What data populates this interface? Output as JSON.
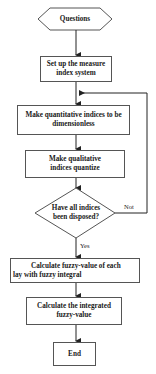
{
  "flowchart": {
    "start": {
      "label": "Questions",
      "shape": "hexagon"
    },
    "steps": [
      {
        "id": "setup",
        "label": "Set up the measure index system"
      },
      {
        "id": "quantitative",
        "label": "Make quantitative indices to be dimensionless"
      },
      {
        "id": "qualitative",
        "label": "Make qualitative indices quantize"
      }
    ],
    "decision": {
      "label": "Have all indices been disposed?",
      "no_label": "Not",
      "yes_label": "Yes"
    },
    "after_steps": [
      {
        "id": "fuzzy_each",
        "label": "Calculate fuzzy-value of each lay with fuzzy integral"
      },
      {
        "id": "integrated",
        "label": "Calculate the integrated fuzzy-value"
      }
    ],
    "end": {
      "label": "End"
    }
  },
  "colors": {
    "line": "#222222",
    "border": "#555555",
    "background": "#ffffff"
  }
}
